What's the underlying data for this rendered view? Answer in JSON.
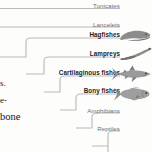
{
  "figure": {
    "type": "cladogram",
    "line_color": "#b9b9b9",
    "plain_label_color": "#6f6f6f",
    "bold_label_color": "#1c1c1c",
    "illustration_color": "#8a8a8a",
    "taxa": [
      {
        "label": "Tunicates",
        "bold": false,
        "illustration": null
      },
      {
        "label": "Lancelets",
        "bold": false,
        "illustration": null
      },
      {
        "label": "Hagfishes",
        "bold": true,
        "illustration": "hagfish-illustration"
      },
      {
        "label": "Lampreys",
        "bold": true,
        "illustration": "lamprey-illustration"
      },
      {
        "label": "Cartilaginous fishes",
        "bold": true,
        "illustration": "shark-illustration"
      },
      {
        "label": "Bony fishes",
        "bold": true,
        "illustration": "bony-fish-illustration"
      },
      {
        "label": "Amphibians",
        "bold": false,
        "illustration": null
      },
      {
        "label": "Reptiles",
        "bold": false,
        "illustration": null
      }
    ]
  },
  "body_text": {
    "line1": "s.",
    "line2": "e-",
    "line3": "bone"
  }
}
